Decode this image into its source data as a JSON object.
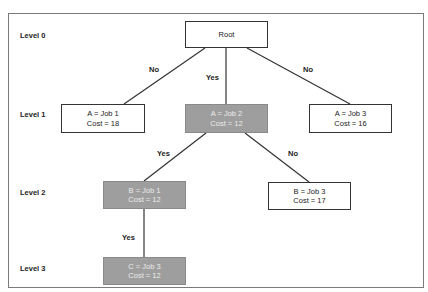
{
  "levels": [
    {
      "label": "Level 0",
      "y": 35
    },
    {
      "label": "Level 1",
      "y": 114
    },
    {
      "label": "Level 2",
      "y": 192
    },
    {
      "label": "Level 3",
      "y": 268
    }
  ],
  "nodes": {
    "root": {
      "line1": "Root",
      "line2": ""
    },
    "a_job1": {
      "line1": "A = Job 1",
      "line2": "Cost = 18"
    },
    "a_job2": {
      "line1": "A = Job 2",
      "line2": "Cost = 12"
    },
    "a_job3": {
      "line1": "A = Job 3",
      "line2": "Cost = 16"
    },
    "b_job1": {
      "line1": "B = Job 1",
      "line2": "Cost = 12"
    },
    "b_job3": {
      "line1": "B = Job 3",
      "line2": "Cost = 17"
    },
    "c_job3": {
      "line1": "C = Job 3",
      "line2": "Cost = 12"
    }
  },
  "edges": {
    "root_a1": "No",
    "root_a2": "Yes",
    "root_a3": "No",
    "a2_b1": "Yes",
    "a2_b3": "No",
    "b1_c3": "Yes"
  },
  "colors": {
    "highlight_fill": "#9e9e9e",
    "highlight_text": "#ececec",
    "line": "#333333",
    "frame": "#7a7a7a"
  }
}
